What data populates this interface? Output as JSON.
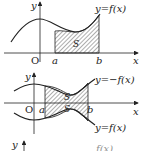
{
  "figure1": {
    "y_axis_label": "y",
    "x_axis_label": "x",
    "origin_label": "O",
    "a_label": "a",
    "b_label": "b",
    "curve_label": "y=f(x)",
    "region_label": "S"
  },
  "figure2": {
    "y_axis_label": "y",
    "x_axis_label": "x",
    "origin_label": "O",
    "a_label": "a",
    "b_label": "b",
    "upper_curve_label": "y=−f(x)",
    "lower_curve_label": "y=f(x)",
    "region_label_upper": "S",
    "region_label_lower": "S"
  },
  "figure3": {
    "y_axis_label": "y",
    "partial_curve_label": "f(x)"
  },
  "colors": {
    "ink": "#222222",
    "background": "#ffffff"
  }
}
